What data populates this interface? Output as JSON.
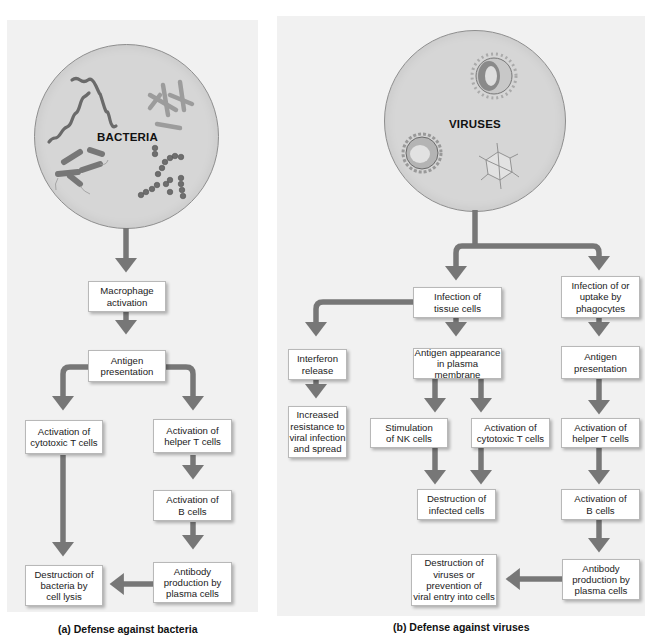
{
  "figure": {
    "panel_a": {
      "circle_label": "BACTERIA",
      "caption": "(a) Defense against bacteria",
      "boxes": [
        {
          "id": "macrophage_activation",
          "text": "Macrophage\nactivation"
        },
        {
          "id": "antigen_presentation",
          "text": "Antigen\npresentation"
        },
        {
          "id": "activation_cytotoxic_t",
          "text": "Activation of\ncytotoxic T cells"
        },
        {
          "id": "activation_helper_t",
          "text": "Activation of\nhelper T cells"
        },
        {
          "id": "activation_b_cells",
          "text": "Activation of\nB cells"
        },
        {
          "id": "destruction_bacteria",
          "text": "Destruction of\nbacteria by\ncell lysis"
        },
        {
          "id": "antibody_production",
          "text": "Antibody\nproduction by\nplasma cells"
        }
      ]
    },
    "panel_b": {
      "circle_label": "VIRUSES",
      "caption": "(b) Defense against viruses",
      "boxes": [
        {
          "id": "infection_tissue_cells",
          "text": "Infection of\ntissue cells"
        },
        {
          "id": "infection_uptake_phagocytes",
          "text": "Infection of or\nuptake by\nphagocytes"
        },
        {
          "id": "interferon_release",
          "text": "Interferon\nrelease"
        },
        {
          "id": "antigen_appearance",
          "text": "Antigen appearance\nin plasma membrane"
        },
        {
          "id": "antigen_presentation",
          "text": "Antigen\npresentation"
        },
        {
          "id": "increased_resistance",
          "text": "Increased\nresistance to\nviral infection\nand spread"
        },
        {
          "id": "stimulation_nk",
          "text": "Stimulation\nof NK cells"
        },
        {
          "id": "activation_cytotoxic_t",
          "text": "Activation of\ncytotoxic T cells"
        },
        {
          "id": "activation_helper_t",
          "text": "Activation of\nhelper T cells"
        },
        {
          "id": "destruction_infected",
          "text": "Destruction of\ninfected cells"
        },
        {
          "id": "activation_b_cells",
          "text": "Activation of\nB cells"
        },
        {
          "id": "destruction_viruses",
          "text": "Destruction of\nviruses or\nprevention of\nviral entry into cells"
        },
        {
          "id": "antibody_production",
          "text": "Antibody\nproduction by\nplasma cells"
        }
      ]
    },
    "colors": {
      "panel_bg": "#f1f1f1",
      "circle_fill": "#d6d6d6",
      "arrow": "#777777",
      "box_border": "#b8b8b8"
    }
  }
}
